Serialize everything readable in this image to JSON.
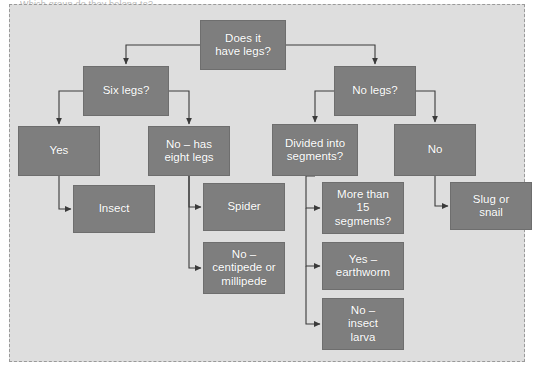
{
  "diagram": {
    "title_sliver": "Which group do they belong to?",
    "panel_background": "#dedede",
    "node_fill": "#7e7e7e",
    "node_text_color": "#ffffff",
    "connector_color": "#3a3a3a",
    "border_style": "dashed"
  },
  "nodes": [
    {
      "id": "root",
      "label": "Does it\nhave legs?",
      "x": 200,
      "y": 20,
      "w": 86,
      "h": 50
    },
    {
      "id": "six_legs",
      "label": "Six legs?",
      "x": 83,
      "y": 66,
      "w": 86,
      "h": 50
    },
    {
      "id": "no_legs",
      "label": "No legs?",
      "x": 334,
      "y": 66,
      "w": 82,
      "h": 50
    },
    {
      "id": "yes",
      "label": "Yes",
      "x": 18,
      "y": 126,
      "w": 82,
      "h": 50
    },
    {
      "id": "eight_legs",
      "label": "No – has\neight legs",
      "x": 148,
      "y": 126,
      "w": 82,
      "h": 50
    },
    {
      "id": "segments_q",
      "label": "Divided into\nsegments?",
      "x": 272,
      "y": 124,
      "w": 86,
      "h": 52
    },
    {
      "id": "no",
      "label": "No",
      "x": 394,
      "y": 124,
      "w": 82,
      "h": 52
    },
    {
      "id": "insect",
      "label": "Insect",
      "x": 73,
      "y": 185,
      "w": 82,
      "h": 48
    },
    {
      "id": "spider",
      "label": "Spider",
      "x": 203,
      "y": 183,
      "w": 82,
      "h": 48
    },
    {
      "id": "more15",
      "label": "More than\n15\nsegments?",
      "x": 322,
      "y": 182,
      "w": 82,
      "h": 52
    },
    {
      "id": "slug",
      "label": "Slug or\nsnail",
      "x": 450,
      "y": 182,
      "w": 82,
      "h": 48
    },
    {
      "id": "centipede",
      "label": "No –\ncentipede or\nmillipede",
      "x": 203,
      "y": 242,
      "w": 82,
      "h": 52
    },
    {
      "id": "earthworm",
      "label": "Yes –\nearthworm",
      "x": 322,
      "y": 242,
      "w": 82,
      "h": 48
    },
    {
      "id": "larva",
      "label": "No –\ninsect\nlarva",
      "x": 322,
      "y": 298,
      "w": 82,
      "h": 52
    }
  ],
  "connectors": [
    {
      "from": "root",
      "to": "six_legs",
      "shape": "down-left-down"
    },
    {
      "from": "root",
      "to": "no_legs",
      "shape": "down-right-down"
    },
    {
      "from": "six_legs",
      "to": "yes",
      "shape": "down-left-down"
    },
    {
      "from": "six_legs",
      "to": "eight_legs",
      "shape": "down-right-down"
    },
    {
      "from": "no_legs",
      "to": "segments_q",
      "shape": "down-left-down"
    },
    {
      "from": "no_legs",
      "to": "no",
      "shape": "down-right-down"
    },
    {
      "from": "yes",
      "to": "insect",
      "shape": "down-right-arrow"
    },
    {
      "from": "eight_legs",
      "to": "spider",
      "shape": "down-right-arrow"
    },
    {
      "from": "eight_legs",
      "to": "centipede",
      "shape": "down-right-arrow"
    },
    {
      "from": "segments_q",
      "to": "more15",
      "shape": "down-right-arrow"
    },
    {
      "from": "segments_q",
      "to": "earthworm",
      "shape": "down-right-arrow"
    },
    {
      "from": "segments_q",
      "to": "larva",
      "shape": "down-right-arrow"
    },
    {
      "from": "no",
      "to": "slug",
      "shape": "down-right-arrow"
    }
  ]
}
